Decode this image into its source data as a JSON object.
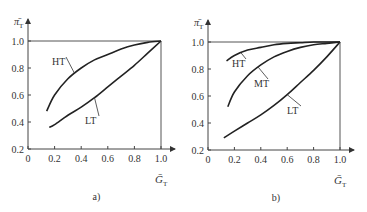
{
  "chart_data": [
    {
      "type": "line",
      "panel": "a)",
      "xlabel": "Ḡ_T",
      "ylabel": "π̄_T",
      "xlim": [
        0,
        1.0
      ],
      "ylim": [
        0.2,
        1.0
      ],
      "xticks": [
        "0",
        "0.2",
        "0.4",
        "0.6",
        "0.8",
        "1.0"
      ],
      "yticks": [
        "0.2",
        "0.4",
        "0.6",
        "0.8",
        "1.0"
      ],
      "series": [
        {
          "name": "HT",
          "x": [
            0.14,
            0.2,
            0.3,
            0.4,
            0.5,
            0.6,
            0.7,
            0.8,
            0.9,
            1.0
          ],
          "y": [
            0.48,
            0.6,
            0.72,
            0.8,
            0.86,
            0.9,
            0.94,
            0.97,
            0.99,
            1.0
          ]
        },
        {
          "name": "LT",
          "x": [
            0.16,
            0.2,
            0.3,
            0.4,
            0.5,
            0.6,
            0.7,
            0.8,
            0.9,
            1.0
          ],
          "y": [
            0.36,
            0.38,
            0.45,
            0.51,
            0.58,
            0.66,
            0.74,
            0.82,
            0.91,
            1.0
          ]
        }
      ]
    },
    {
      "type": "line",
      "panel": "b)",
      "xlabel": "Ḡ_T",
      "ylabel": "π̄_T",
      "xlim": [
        0,
        1.0
      ],
      "ylim": [
        0.2,
        1.0
      ],
      "xticks": [
        "0",
        "0.2",
        "0.4",
        "0.6",
        "0.8",
        "1.0"
      ],
      "yticks": [
        "0.2",
        "0.4",
        "0.6",
        "0.8",
        "1.0"
      ],
      "series": [
        {
          "name": "HT",
          "x": [
            0.14,
            0.2,
            0.3,
            0.4,
            0.5,
            0.6,
            0.7,
            0.8,
            0.9,
            1.0
          ],
          "y": [
            0.86,
            0.9,
            0.94,
            0.96,
            0.98,
            0.99,
            0.995,
            1.0,
            1.0,
            1.0
          ]
        },
        {
          "name": "MT",
          "x": [
            0.15,
            0.2,
            0.3,
            0.4,
            0.5,
            0.6,
            0.7,
            0.8,
            0.9,
            1.0
          ],
          "y": [
            0.52,
            0.63,
            0.75,
            0.83,
            0.89,
            0.93,
            0.96,
            0.98,
            0.99,
            1.0
          ]
        },
        {
          "name": "LT",
          "x": [
            0.12,
            0.2,
            0.3,
            0.4,
            0.5,
            0.6,
            0.7,
            0.8,
            0.9,
            1.0
          ],
          "y": [
            0.29,
            0.34,
            0.4,
            0.46,
            0.53,
            0.61,
            0.7,
            0.79,
            0.89,
            1.0
          ]
        }
      ]
    }
  ],
  "panels": [
    {
      "label": "a)",
      "ylabel": "π̄",
      "ysub": "T",
      "xlabel": "Ḡ",
      "xsub": "T"
    },
    {
      "label": "b)",
      "ylabel": "π̄",
      "ysub": "T",
      "xlabel": "Ḡ",
      "xsub": "T"
    }
  ]
}
